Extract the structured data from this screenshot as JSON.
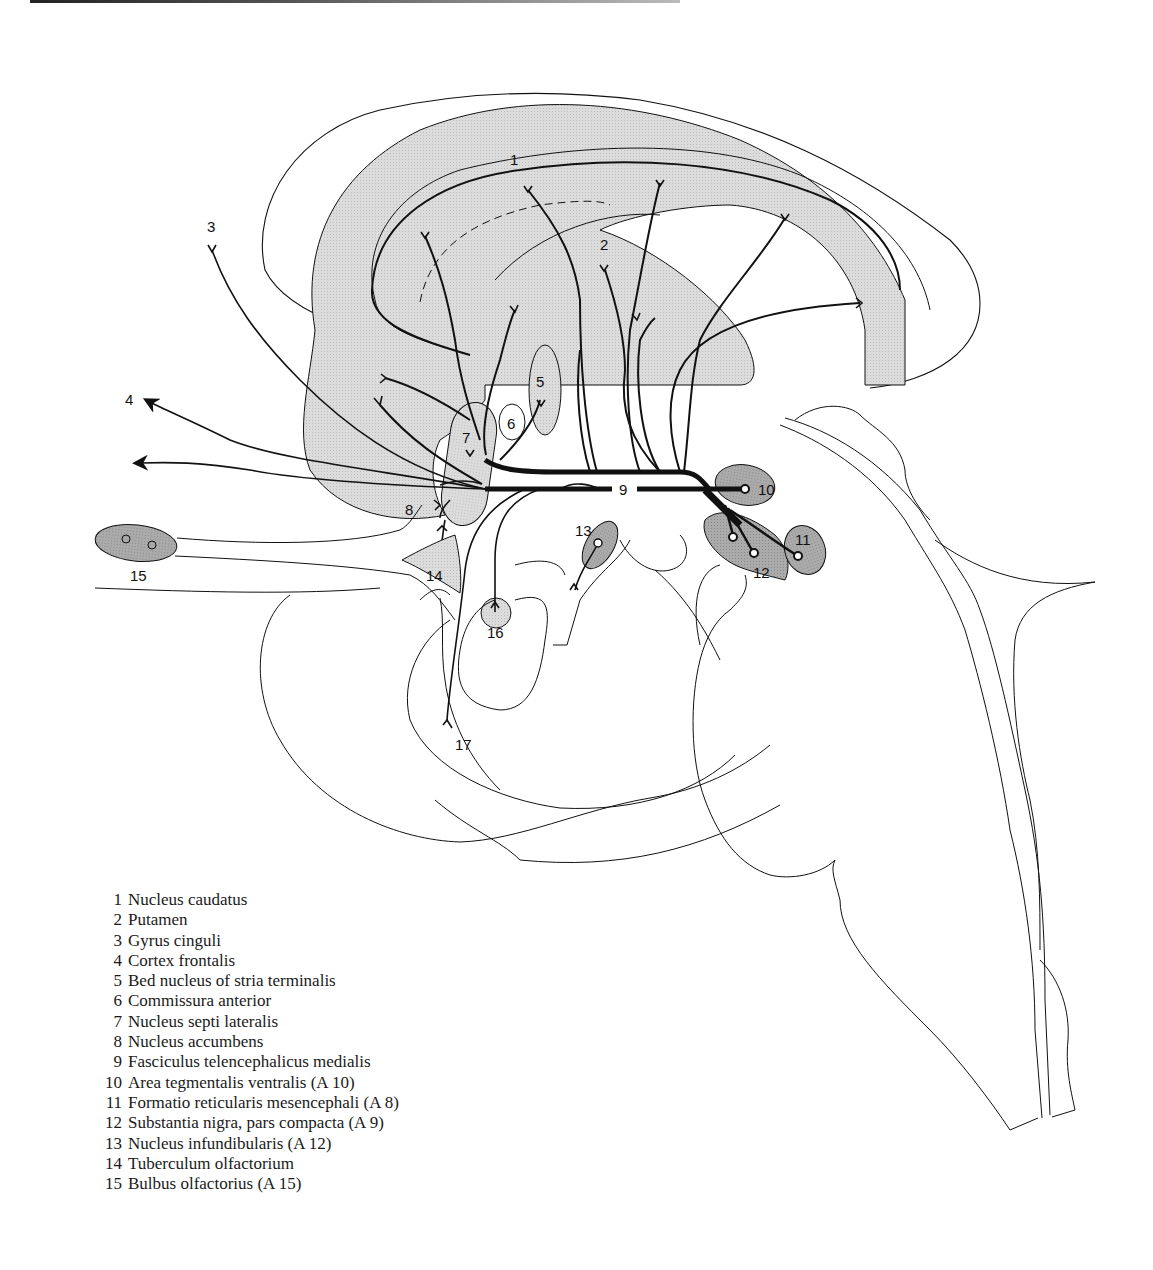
{
  "figure": {
    "type": "sagittal brain diagram",
    "colors": {
      "region_fill_light": "#d6d6d6",
      "nucleus_fill_dark": "#a8a8a8",
      "line": "#111111",
      "background": "#ffffff"
    },
    "labels": [
      {
        "id": "1",
        "text": "1"
      },
      {
        "id": "2",
        "text": "2"
      },
      {
        "id": "3",
        "text": "3"
      },
      {
        "id": "4",
        "text": "4"
      },
      {
        "id": "5",
        "text": "5"
      },
      {
        "id": "6",
        "text": "6"
      },
      {
        "id": "7",
        "text": "7"
      },
      {
        "id": "8",
        "text": "8"
      },
      {
        "id": "9",
        "text": "9"
      },
      {
        "id": "10",
        "text": "10"
      },
      {
        "id": "11",
        "text": "11"
      },
      {
        "id": "12",
        "text": "12"
      },
      {
        "id": "13",
        "text": "13"
      },
      {
        "id": "14",
        "text": "14"
      },
      {
        "id": "15",
        "text": "15"
      },
      {
        "id": "16",
        "text": "16"
      },
      {
        "id": "17",
        "text": "17"
      }
    ]
  },
  "legend": [
    {
      "num": "1",
      "name": "Nucleus caudatus"
    },
    {
      "num": "2",
      "name": "Putamen"
    },
    {
      "num": "3",
      "name": "Gyrus cinguli"
    },
    {
      "num": "4",
      "name": "Cortex frontalis"
    },
    {
      "num": "5",
      "name": "Bed nucleus of stria terminalis"
    },
    {
      "num": "6",
      "name": "Commissura anterior"
    },
    {
      "num": "7",
      "name": "Nucleus septi lateralis"
    },
    {
      "num": "8",
      "name": "Nucleus accumbens"
    },
    {
      "num": "9",
      "name": "Fasciculus telencephalicus medialis"
    },
    {
      "num": "10",
      "name": "Area tegmentalis ventralis (A 10)"
    },
    {
      "num": "11",
      "name": "Formatio reticularis mesencephali (A 8)"
    },
    {
      "num": "12",
      "name": "Substantia nigra, pars compacta (A 9)"
    },
    {
      "num": "13",
      "name": "Nucleus infundibularis (A 12)"
    },
    {
      "num": "14",
      "name": "Tuberculum olfactorium"
    },
    {
      "num": "15",
      "name": "Bulbus olfactorius (A 15)"
    }
  ]
}
